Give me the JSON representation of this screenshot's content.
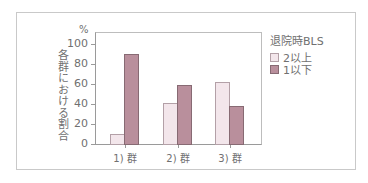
{
  "chart_data": {
    "type": "bar",
    "title": "",
    "xlabel": "",
    "ylabel": "各群における割合",
    "yunit": "%",
    "ylim": [
      0,
      100
    ],
    "yticks": [
      0,
      20,
      40,
      60,
      80,
      100
    ],
    "categories": [
      "1) 群",
      "2) 群",
      "3) 群"
    ],
    "legend_title": "退院時BLS",
    "legend_position": "right",
    "grid": false,
    "series": [
      {
        "name": "2以上",
        "color": "#f3e6eb",
        "values": [
          10,
          41,
          62
        ]
      },
      {
        "name": "1以下",
        "color": "#b98f9c",
        "values": [
          90,
          59,
          38
        ]
      }
    ]
  }
}
